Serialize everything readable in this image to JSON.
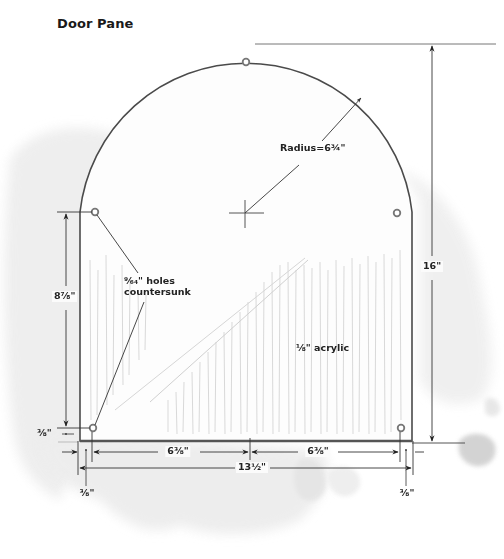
{
  "title": "Door Pane",
  "labels": {
    "radius": "Radius=6¾\"",
    "holes_line1": "⁹⁄₆₄\" holes",
    "holes_line2": "countersunk",
    "material": "⅛\" acrylic",
    "height_total": "16\"",
    "height_holes": "8⅞\"",
    "offset_left_side": "⅜\"",
    "width_left_half": "6⅜\"",
    "width_right_half": "6⅜\"",
    "width_total": "13½\"",
    "offset_bottom_left": "⅜\"",
    "offset_bottom_right": "⅜\""
  },
  "diagram": {
    "type": "technical-drawing",
    "dimensions": {
      "radius_in": 6.75,
      "total_height_in": 16,
      "total_width_in": 13.5,
      "half_width_in": 6.375,
      "hole_spacing_vertical_in": 8.875,
      "hole_edge_offset_in": 0.375,
      "hole_diameter_in": 0.140625,
      "material_thickness_in": 0.125
    },
    "holes_count": 5
  },
  "colors": {
    "line": "#333333",
    "outline": "#555555",
    "wash": "#e6e6e6",
    "text": "#222222"
  }
}
